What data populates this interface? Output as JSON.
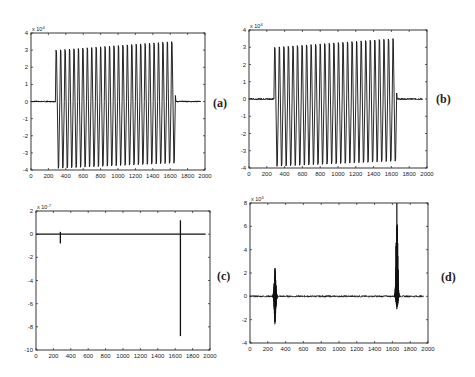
{
  "figure": {
    "panels": [
      {
        "id": "a",
        "label": "(a)"
      },
      {
        "id": "b",
        "label": "(b)"
      },
      {
        "id": "c",
        "label": "(c)"
      },
      {
        "id": "d",
        "label": "(d)"
      }
    ]
  },
  "chart_data": [
    {
      "panel": "(a)",
      "type": "line",
      "title": "",
      "xlabel": "",
      "ylabel": "",
      "y_exponent_label": "x 10^4",
      "xlim": [
        0,
        2000
      ],
      "ylim": [
        -4,
        4
      ],
      "xticks": [
        0,
        200,
        400,
        600,
        800,
        1000,
        1200,
        1400,
        1600,
        1800,
        2000
      ],
      "yticks": [
        -4,
        -3,
        -2,
        -1,
        0,
        1,
        2,
        3,
        4
      ],
      "grid": false,
      "description": "Near-zero baseline from 0 to ~280, dense oscillation (~27 cycles) from ~280 to ~1660 with peaks rising from ~3.0 to ~3.5 and troughs ~-3.9 to -3.6, then near-zero baseline from ~1660 to ~1950",
      "signal": {
        "start": 280,
        "end": 1660,
        "cycles": 27,
        "peak_start": 3.0,
        "peak_end": 3.5,
        "trough_start": -3.9,
        "trough_end": -3.6,
        "baseline_end": 1950
      }
    },
    {
      "panel": "(b)",
      "type": "line",
      "title": "",
      "xlabel": "",
      "ylabel": "",
      "y_exponent_label": "x 10^4",
      "xlim": [
        0,
        2000
      ],
      "ylim": [
        -4,
        4
      ],
      "xticks": [
        0,
        200,
        400,
        600,
        800,
        1000,
        1200,
        1400,
        1600,
        1800,
        2000
      ],
      "yticks": [
        -4,
        -3,
        -2,
        -1,
        0,
        1,
        2,
        3,
        4
      ],
      "grid": false,
      "description": "Same as (a): flat baseline, oscillation burst from ~280 to ~1660, flat baseline to ~1950",
      "signal": {
        "start": 280,
        "end": 1660,
        "cycles": 27,
        "peak_start": 3.0,
        "peak_end": 3.5,
        "trough_start": -3.9,
        "trough_end": -3.6,
        "baseline_end": 1950
      }
    },
    {
      "panel": "(c)",
      "type": "line",
      "title": "",
      "xlabel": "",
      "ylabel": "",
      "y_exponent_label": "x 10^-7",
      "xlim": [
        0,
        2000
      ],
      "ylim": [
        -10,
        2
      ],
      "xticks": [
        0,
        200,
        400,
        600,
        800,
        1000,
        1200,
        1400,
        1600,
        1800,
        2000
      ],
      "yticks": [
        -10,
        -8,
        -6,
        -4,
        -2,
        0,
        2
      ],
      "grid": false,
      "description": "Flat line at 0 with a small spike at ~280 (down to ~-0.8) and a large spike at ~1660 (from ~1.2 down to ~-8.8)",
      "spikes": [
        {
          "x": 280,
          "max": 0.2,
          "min": -0.8
        },
        {
          "x": 1660,
          "max": 1.2,
          "min": -8.8
        }
      ]
    },
    {
      "panel": "(d)",
      "type": "line",
      "title": "",
      "xlabel": "",
      "ylabel": "",
      "y_exponent_label": "x 10^4",
      "xlim": [
        0,
        2000
      ],
      "ylim": [
        -4,
        8
      ],
      "xticks": [
        0,
        200,
        400,
        600,
        800,
        1000,
        1200,
        1400,
        1600,
        1800,
        2000
      ],
      "yticks": [
        -4,
        -2,
        0,
        2,
        4,
        6,
        8
      ],
      "grid": false,
      "description": "Noisy line near 0 with a burst at ~280 (range ~-2.4 to 2.4) and a burst at ~1650 (range ~-1.1 to 8)",
      "bursts": [
        {
          "x": 280,
          "max": 2.4,
          "min": -2.4
        },
        {
          "x": 1650,
          "max": 8.0,
          "min": -1.1
        }
      ]
    }
  ]
}
